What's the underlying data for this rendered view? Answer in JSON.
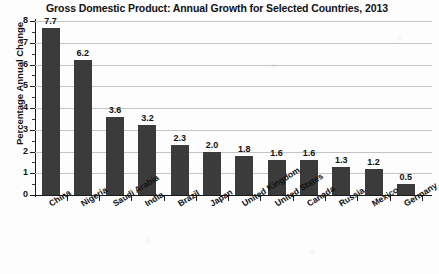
{
  "chart_data": {
    "type": "bar",
    "title": "Gross Domestic Product: Annual Growth for Selected Countries, 2013",
    "xlabel": "",
    "ylabel": "Percentage Annual Change",
    "categories": [
      "China",
      "Nigeria",
      "Saudi Arabia",
      "India",
      "Brazil",
      "Japan",
      "United Kingdom",
      "United States",
      "Canada",
      "Russia",
      "Mexico",
      "Germany"
    ],
    "values": [
      7.7,
      6.2,
      3.6,
      3.2,
      2.3,
      2.0,
      1.8,
      1.6,
      1.6,
      1.3,
      1.2,
      0.5
    ],
    "value_labels": [
      "7.7",
      "6.2",
      "3.6",
      "3.2",
      "2.3",
      "2.0",
      "1.8",
      "1.6",
      "1.6",
      "1.3",
      "1.2",
      "0.5"
    ],
    "ylim": [
      0,
      8
    ],
    "yticks": [
      0,
      1,
      2,
      3,
      4,
      5,
      6,
      7,
      8
    ],
    "ytick_labels": [
      "0",
      "1",
      "2",
      "3",
      "4",
      "5",
      "6",
      "7",
      "8"
    ],
    "grid": "horizontal",
    "legend": "none",
    "bar_color": "#3b3b3b",
    "gridline_color": "#c4c4c4",
    "axis_color": "#1a1a1a",
    "background_color": "#fdfdfd"
  }
}
